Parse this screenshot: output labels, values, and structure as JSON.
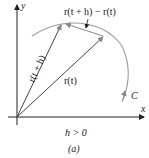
{
  "diagram": {
    "axes": {
      "x_label": "x",
      "y_label": "y"
    },
    "vectors": {
      "r_t": "r(t)",
      "r_t_plus_h": "r(t + h)",
      "difference": "r(t + h) − r(t)"
    },
    "curve_label": "C",
    "condition": "h > 0",
    "caption": "(a)",
    "colors": {
      "axis": "#222222",
      "curve": "#9a9a9a",
      "vector": "#444444"
    }
  }
}
